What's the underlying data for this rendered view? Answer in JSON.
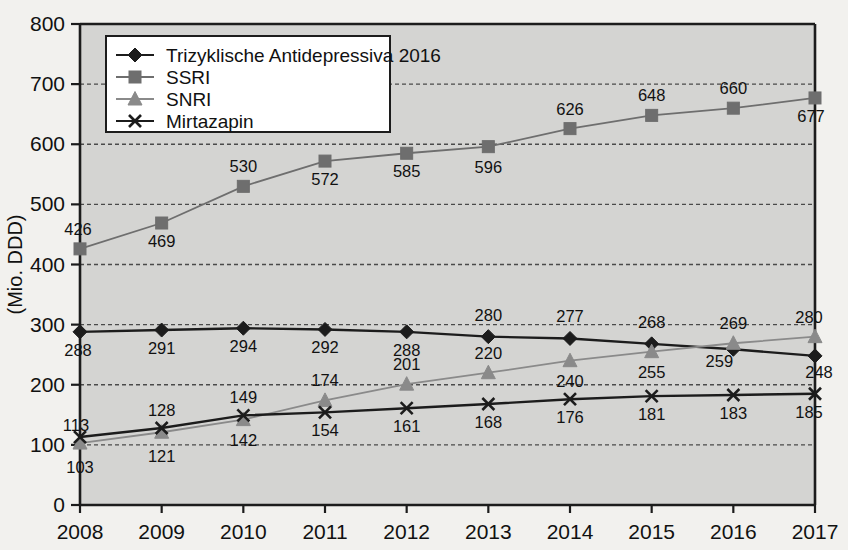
{
  "chart_data": {
    "type": "line",
    "title": "",
    "xlabel": "",
    "ylabel": "(Mio. DDD)",
    "categories": [
      "2008",
      "2009",
      "2010",
      "2011",
      "2012",
      "2013",
      "2014",
      "2015",
      "2016",
      "2017"
    ],
    "ylim": [
      0,
      800
    ],
    "yticks": [
      0,
      100,
      200,
      300,
      400,
      500,
      600,
      700,
      800
    ],
    "grid": true,
    "legend_position": "top-left",
    "series": [
      {
        "name": "Trizyklische Antidepressiva 2016",
        "marker": "diamond",
        "color": "#1c1c1c",
        "values": [
          288,
          291,
          294,
          292,
          288,
          280,
          277,
          268,
          259,
          248
        ]
      },
      {
        "name": "SSRI",
        "marker": "square",
        "color": "#6e6e6e",
        "values": [
          426,
          469,
          530,
          572,
          585,
          596,
          626,
          648,
          660,
          677
        ]
      },
      {
        "name": "SNRI",
        "marker": "triangle",
        "color": "#8a8a8a",
        "values": [
          103,
          121,
          142,
          174,
          201,
          220,
          240,
          255,
          269,
          280
        ]
      },
      {
        "name": "Mirtazapin",
        "marker": "cross",
        "color": "#1c1c1c",
        "values": [
          113,
          128,
          149,
          154,
          161,
          168,
          176,
          181,
          183,
          185
        ]
      }
    ]
  },
  "labels": {
    "y_ticks": [
      "0",
      "100",
      "200",
      "300",
      "400",
      "500",
      "600",
      "700",
      "800"
    ],
    "x_ticks": [
      "2008",
      "2009",
      "2010",
      "2011",
      "2012",
      "2013",
      "2014",
      "2015",
      "2016",
      "2017"
    ],
    "y_axis_title": "(Mio. DDD)"
  },
  "legend": {
    "items": [
      {
        "label": "Trizyklische Antidepressiva 2016",
        "marker": "diamond-icon"
      },
      {
        "label": "SSRI",
        "marker": "square-icon"
      },
      {
        "label": "SNRI",
        "marker": "triangle-icon"
      },
      {
        "label": "Mirtazapin",
        "marker": "cross-icon"
      }
    ]
  },
  "colors": {
    "plot_background": "#d4d4d2",
    "page_background": "#f2f1ee",
    "axis": "#1c1c1c",
    "grid": "#4a4a4a",
    "tza": "#1c1c1c",
    "ssri": "#6e6e6e",
    "snri": "#8a8a8a",
    "mirtazapin": "#1c1c1c"
  }
}
